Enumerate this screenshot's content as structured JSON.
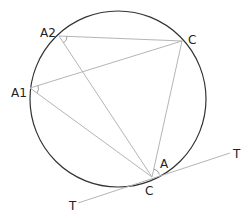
{
  "diagram": {
    "circle": {
      "cx": 118,
      "cy": 99,
      "r": 88,
      "stroke": "#333333"
    },
    "points": {
      "A2": {
        "x": 59,
        "y": 36,
        "label": "A2"
      },
      "C_top": {
        "x": 182,
        "y": 41,
        "label": "C"
      },
      "A1": {
        "x": 30,
        "y": 88,
        "label": "A1"
      },
      "C_bottom": {
        "x": 152,
        "y": 177,
        "label": "C"
      },
      "T_right": {
        "x": 230,
        "y": 153,
        "label": "T"
      },
      "T_left": {
        "x": 78,
        "y": 203,
        "label": "T"
      }
    },
    "angle_label": "A",
    "chord_color": "#b0b0b0"
  }
}
